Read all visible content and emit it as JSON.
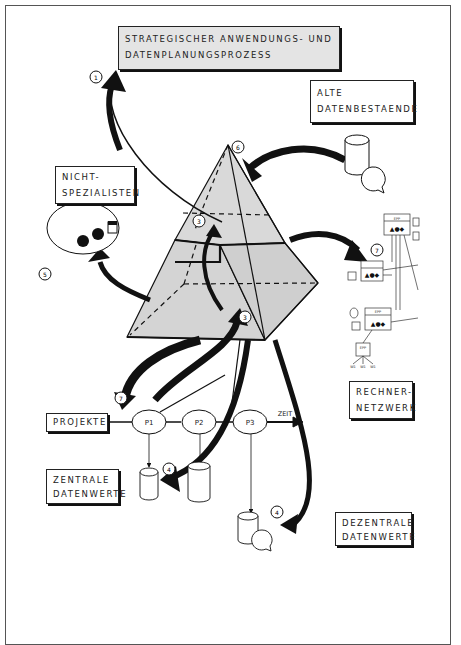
{
  "labels": {
    "strategic_process": [
      "STRATEGISCHER ANWENDUNGS- UND",
      "DATENPLANUNGSPROZESS"
    ],
    "old_data": [
      "ALTE",
      "DATENBESTAENDE"
    ],
    "non_specialists": [
      "NICHT-",
      "SPEZIALISTEN"
    ],
    "computer_network": [
      "RECHNER-",
      "NETZWERK"
    ],
    "projects": [
      "PROJEKTE"
    ],
    "central_data": [
      "ZENTRALE",
      "DATENWERTE"
    ],
    "decentral_data": [
      "DEZENTRALE",
      "DATENWERTE"
    ]
  },
  "timeline": {
    "projects": [
      "P1",
      "P2",
      "P3"
    ],
    "axis_label": "ZEIT"
  },
  "step_markers": {
    "m1": "1",
    "m3a": "3",
    "m3b": "3",
    "m4a": "4",
    "m4b": "4",
    "m5": "5",
    "m6": "6",
    "m7": "7",
    "m_net": "7"
  },
  "network": {
    "node_label": "EPP",
    "terminal_labels": [
      "W1",
      "W1",
      "W1"
    ]
  },
  "colors": {
    "ink": "#111111",
    "pyramid_fill": "#d9d9d9",
    "title_box_fill": "#e4e4e4",
    "frame": "#555555"
  }
}
